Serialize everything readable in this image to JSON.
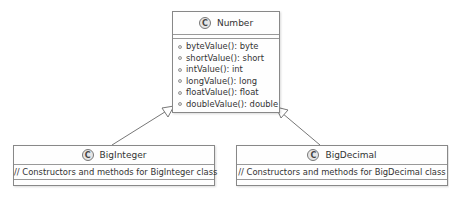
{
  "diagram_type": "UML class diagram",
  "classes": {
    "number": {
      "stereotype_icon": "C",
      "name": "Number",
      "methods": [
        "byteValue(): byte",
        "shortValue(): short",
        "intValue(): int",
        "longValue(): long",
        "floatValue(): float",
        "doubleValue(): double"
      ]
    },
    "biginteger": {
      "stereotype_icon": "C",
      "name": "BigInteger",
      "comment": "// Constructors and methods for BigInteger class"
    },
    "bigdecimal": {
      "stereotype_icon": "C",
      "name": "BigDecimal",
      "comment": "// Constructors and methods for BigDecimal class"
    }
  },
  "relations": [
    {
      "from": "BigInteger",
      "to": "Number",
      "type": "inheritance"
    },
    {
      "from": "BigDecimal",
      "to": "Number",
      "type": "inheritance"
    }
  ],
  "colors": {
    "line": "#777777",
    "box_border": "#888888",
    "icon_fill": "#e6e6e6"
  }
}
